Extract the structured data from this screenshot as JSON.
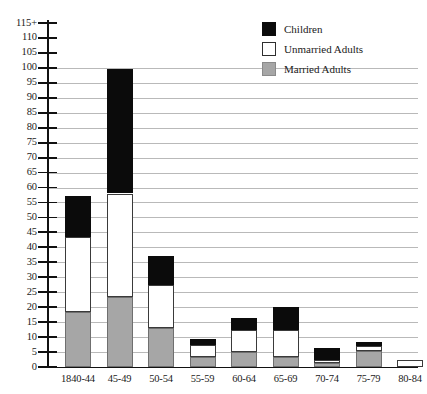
{
  "chart_data": {
    "type": "bar",
    "subtype": "stacked-vertical",
    "title": "",
    "xlabel": "",
    "ylabel": "",
    "ylim": [
      0,
      115
    ],
    "ytick_step": 5,
    "ytick_labels": [
      "0",
      "5",
      "10",
      "15",
      "20",
      "25",
      "30",
      "35",
      "40",
      "45",
      "50",
      "55",
      "60",
      "65",
      "70",
      "75",
      "80",
      "85",
      "90",
      "95",
      "100",
      "105",
      "110",
      "115+"
    ],
    "grid": true,
    "grid_axis": "y",
    "legend_position": "top-right",
    "categories": [
      "1840-44",
      "45-49",
      "50-54",
      "55-59",
      "60-64",
      "65-69",
      "70-74",
      "75-79",
      "80-84"
    ],
    "series": [
      {
        "name": "Married Adults",
        "color": "#a6a6a6",
        "values": [
          18.5,
          23.5,
          13,
          3.5,
          5,
          3.5,
          1.5,
          5.5,
          0
        ]
      },
      {
        "name": "Unmarried Adults",
        "color": "#ffffff",
        "values": [
          25,
          34.5,
          14.5,
          4,
          7.5,
          9,
          1,
          1.5,
          2.5
        ]
      },
      {
        "name": "Children",
        "color": "#0b0b0b",
        "values": [
          13.5,
          41.5,
          9.5,
          2,
          4,
          7.5,
          4,
          1.5,
          0
        ]
      }
    ],
    "totals": [
      57,
      99.5,
      37,
      9.5,
      16.5,
      20,
      6.5,
      8.5,
      2.5
    ]
  },
  "legend": {
    "items": [
      {
        "label": "Children",
        "swatch": "children"
      },
      {
        "label": "Unmarried Adults",
        "swatch": "unmarried"
      },
      {
        "label": "Married Adults",
        "swatch": "married"
      }
    ]
  }
}
